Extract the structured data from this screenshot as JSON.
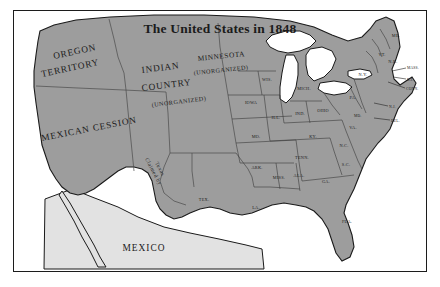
{
  "figure": {
    "title": "The United States in 1848",
    "frame_color": "#1c1c1c",
    "land_color": "#9d9d9d",
    "lake_color": "#ffffff",
    "background_color": "#ffffff",
    "mexico_fill_color": "#e2e2e2"
  },
  "territories": [
    {
      "id": "oregon",
      "line1": "OREGON",
      "line2": "TERRITORY"
    },
    {
      "id": "indian",
      "line1": "INDIAN",
      "line2": "COUNTRY",
      "line3": "(UNORGANIZED)"
    },
    {
      "id": "minnesota",
      "line1": "MINNESOTA",
      "line2": "(UNORGANIZED)"
    },
    {
      "id": "mexican-cession",
      "line1": "MEXICAN CESSION"
    },
    {
      "id": "claimed-by-texas",
      "line1": "Claimed by",
      "line2": "Texas"
    }
  ],
  "labels": {
    "oregon_line1": "OREGON",
    "oregon_line2": "TERRITORY",
    "indian_line1": "INDIAN",
    "indian_line2": "COUNTRY",
    "indian_line3": "(UNORGANIZED)",
    "minnesota_line1": "MINNESOTA",
    "minnesota_line2": "(UNORGANIZED)",
    "mexican_cession": "MEXICAN CESSION",
    "claimed_line1": "Claimed by",
    "claimed_line2": "Texas",
    "mexico": "MEXICO"
  },
  "states": [
    {
      "abbr": "WIS.",
      "name": "Wisconsin"
    },
    {
      "abbr": "MICH.",
      "name": "Michigan"
    },
    {
      "abbr": "IOWA",
      "name": "Iowa"
    },
    {
      "abbr": "ILL.",
      "name": "Illinois"
    },
    {
      "abbr": "IND.",
      "name": "Indiana"
    },
    {
      "abbr": "OHIO",
      "name": "Ohio"
    },
    {
      "abbr": "MO.",
      "name": "Missouri"
    },
    {
      "abbr": "KY.",
      "name": "Kentucky"
    },
    {
      "abbr": "TENN.",
      "name": "Tennessee"
    },
    {
      "abbr": "ARK.",
      "name": "Arkansas"
    },
    {
      "abbr": "MISS.",
      "name": "Mississippi"
    },
    {
      "abbr": "ALA.",
      "name": "Alabama"
    },
    {
      "abbr": "GA.",
      "name": "Georgia"
    },
    {
      "abbr": "LA.",
      "name": "Louisiana"
    },
    {
      "abbr": "TEX.",
      "name": "Texas"
    },
    {
      "abbr": "FLA.",
      "name": "Florida"
    },
    {
      "abbr": "S.C.",
      "name": "South Carolina"
    },
    {
      "abbr": "N.C.",
      "name": "North Carolina"
    },
    {
      "abbr": "VA.",
      "name": "Virginia"
    },
    {
      "abbr": "PA.",
      "name": "Pennsylvania"
    },
    {
      "abbr": "N.Y.",
      "name": "New York"
    },
    {
      "abbr": "ME.",
      "name": "Maine"
    },
    {
      "abbr": "VT.",
      "name": "Vermont"
    },
    {
      "abbr": "N.H.",
      "name": "New Hampshire"
    },
    {
      "abbr": "MASS.",
      "name": "Massachusetts"
    },
    {
      "abbr": "R.I.",
      "name": "Rhode Island"
    },
    {
      "abbr": "CONN.",
      "name": "Connecticut"
    },
    {
      "abbr": "N.J.",
      "name": "New Jersey"
    },
    {
      "abbr": "DEL.",
      "name": "Delaware"
    },
    {
      "abbr": "MD.",
      "name": "Maryland"
    }
  ],
  "state_labels": {
    "wis": "WIS.",
    "mich": "MICH.",
    "iowa": "IOWA",
    "ill": "ILL.",
    "ind": "IND.",
    "ohio": "OHIO",
    "mo": "MO.",
    "ky": "KY.",
    "tenn": "TENN.",
    "ark": "ARK.",
    "miss": "MISS.",
    "ala": "ALA.",
    "ga": "GA.",
    "la": "LA.",
    "tex": "TEX.",
    "fla": "FLA.",
    "sc": "S.C.",
    "nc": "N.C.",
    "va": "VA.",
    "pa": "PA.",
    "ny": "N.Y.",
    "me": "ME.",
    "vt": "VT.",
    "nh": "N.H.",
    "mass": "MASS.",
    "ri": "R.I.",
    "conn": "CONN.",
    "nj": "N.J.",
    "del": "DEL.",
    "md": "MD."
  }
}
